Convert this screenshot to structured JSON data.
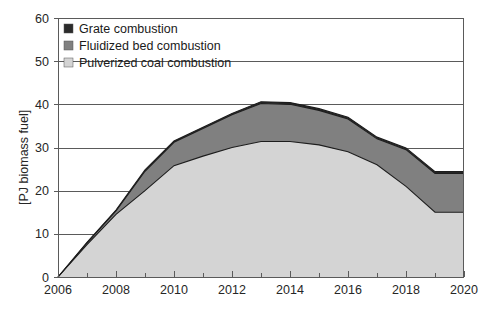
{
  "chart_data": {
    "type": "area",
    "stacked": true,
    "title": "",
    "xlabel": "",
    "ylabel": "[PJ biomass fuel]",
    "xlim": [
      2006,
      2020
    ],
    "ylim": [
      0,
      60
    ],
    "x": [
      2006,
      2007,
      2008,
      2009,
      2010,
      2011,
      2012,
      2013,
      2014,
      2015,
      2016,
      2017,
      2018,
      2019,
      2020
    ],
    "xticks": [
      2006,
      2008,
      2010,
      2012,
      2014,
      2016,
      2018,
      2020
    ],
    "xtick_labels": [
      "2006",
      "2008",
      "2010",
      "2012",
      "2014",
      "2016",
      "2018",
      "2020"
    ],
    "xminor_ticks": [
      2007,
      2009,
      2011,
      2013,
      2015,
      2017,
      2019
    ],
    "yticks": [
      0,
      10,
      20,
      30,
      40,
      50,
      60
    ],
    "ytick_labels": [
      "0",
      "10",
      "20",
      "30",
      "40",
      "50",
      "60"
    ],
    "grid": "horizontal",
    "legend_position": "top-left",
    "series": [
      {
        "name": "Pulverized coal combustion",
        "color": "#d4d4d4",
        "values": [
          0,
          7.5,
          14.5,
          20.0,
          25.8,
          28.0,
          30.0,
          31.4,
          31.4,
          30.6,
          29.0,
          26.0,
          21.0,
          15.0,
          15.0
        ]
      },
      {
        "name": "Fluidized bed combustion",
        "color": "#808080",
        "values": [
          0,
          0.4,
          0.8,
          4.5,
          5.4,
          6.4,
          7.6,
          8.8,
          8.6,
          8.0,
          7.6,
          6.0,
          8.5,
          9.0,
          9.0
        ]
      },
      {
        "name": "Grate combustion",
        "color": "#2b2b2b",
        "values": [
          0,
          0.1,
          0.2,
          0.3,
          0.3,
          0.3,
          0.3,
          0.4,
          0.4,
          0.4,
          0.4,
          0.4,
          0.4,
          0.4,
          0.4
        ]
      }
    ],
    "totals": [
      0,
      8.0,
      15.5,
      24.8,
      31.5,
      34.7,
      37.9,
      40.6,
      40.4,
      39.0,
      37.0,
      32.4,
      29.9,
      24.4,
      24.4
    ]
  },
  "legend": {
    "items": [
      {
        "label": "Grate combustion",
        "color": "#2b2b2b"
      },
      {
        "label": "Fluidized bed combustion",
        "color": "#808080"
      },
      {
        "label": "Pulverized coal combustion",
        "color": "#d4d4d4"
      }
    ]
  },
  "axes": {
    "y_title": "[PJ biomass fuel]"
  }
}
